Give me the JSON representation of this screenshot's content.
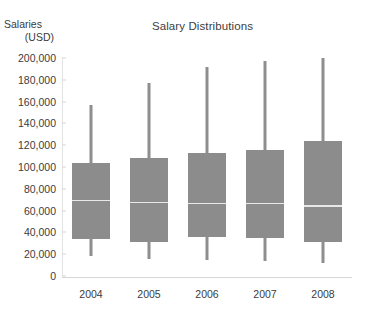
{
  "chart_data": {
    "type": "box",
    "title": "Salary Distributions",
    "xlabel": "",
    "ylabel_lines": [
      "Salaries",
      "(USD)"
    ],
    "categories": [
      "2004",
      "2005",
      "2006",
      "2007",
      "2008"
    ],
    "ylim": [
      0,
      200000
    ],
    "ytick_values": [
      0,
      20000,
      40000,
      60000,
      80000,
      100000,
      120000,
      140000,
      160000,
      180000,
      200000
    ],
    "ytick_labels": [
      "0",
      "20,000",
      "40,000",
      "60,000",
      "80,000",
      "100,000",
      "120,000",
      "140,000",
      "160,000",
      "180,000",
      "200,000"
    ],
    "grid": false,
    "legend": "none",
    "box_fill_color": "#8c8c8c",
    "median_color": "#e8e8e8",
    "whisker_color": "#8e8e8e",
    "boxes": [
      {
        "category": "2004",
        "min": 18000,
        "q1": 34000,
        "median": 70000,
        "q3": 104000,
        "max": 157000
      },
      {
        "category": "2005",
        "min": 16000,
        "q1": 31000,
        "median": 68000,
        "q3": 108000,
        "max": 177000
      },
      {
        "category": "2006",
        "min": 15000,
        "q1": 36000,
        "median": 67000,
        "q3": 113000,
        "max": 192000
      },
      {
        "category": "2007",
        "min": 14000,
        "q1": 35000,
        "median": 67000,
        "q3": 116000,
        "max": 197000
      },
      {
        "category": "2008",
        "min": 12000,
        "q1": 31000,
        "median": 65000,
        "q3": 124000,
        "max": 200000
      }
    ]
  }
}
